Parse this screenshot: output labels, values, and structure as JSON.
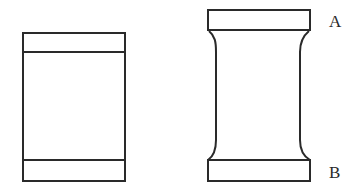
{
  "diagram": {
    "stroke_color": "#2a2a2a",
    "background": "#ffffff",
    "left_specimen": {
      "shape": "straight-rectangle-with-end-bands"
    },
    "right_specimen": {
      "shape": "waisted-spool-with-end-caps",
      "labels": {
        "top": "A",
        "bottom": "B"
      }
    }
  }
}
